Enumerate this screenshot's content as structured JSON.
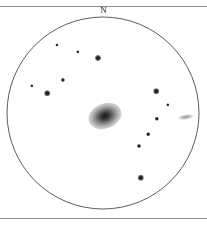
{
  "figure": {
    "type": "astronomical-finder-chart",
    "background_color": "#ffffff",
    "width": 207,
    "height": 226
  },
  "rules": {
    "top_y": 6,
    "bottom_y": 218,
    "color": "#8c8c8c"
  },
  "orientation": {
    "north_label": "N",
    "label_x": 103,
    "label_y": 11
  },
  "field_of_view": {
    "shape": "circle",
    "center_x": 103,
    "center_y": 113,
    "radius": 96,
    "stroke_color": "#4a4a4a",
    "stroke_width": 0.9,
    "fill": "none"
  },
  "chart_data": {
    "type": "scatter",
    "title": "",
    "xlabel": "",
    "ylabel": "",
    "objects": [
      {
        "name": "central-galaxy",
        "kind": "galaxy",
        "x": 105,
        "y": 116,
        "width": 34,
        "height": 25,
        "angle": -22,
        "brightness": "bright"
      },
      {
        "name": "companion-galaxy",
        "kind": "galaxy",
        "x": 186,
        "y": 117,
        "width": 15,
        "height": 5,
        "angle": -8,
        "brightness": "faint"
      },
      {
        "name": "star-01",
        "kind": "star",
        "x": 57,
        "y": 45,
        "size": 3.2,
        "brightness": "faint"
      },
      {
        "name": "star-02",
        "kind": "star",
        "x": 78,
        "y": 52,
        "size": 3.4,
        "brightness": "faint"
      },
      {
        "name": "star-03",
        "kind": "star",
        "x": 98,
        "y": 58,
        "size": 6.0,
        "brightness": "bright"
      },
      {
        "name": "star-04",
        "kind": "star",
        "x": 63,
        "y": 80,
        "size": 4.2,
        "brightness": "medium"
      },
      {
        "name": "star-05",
        "kind": "star",
        "x": 32,
        "y": 86,
        "size": 3.4,
        "brightness": "faint"
      },
      {
        "name": "star-06",
        "kind": "star",
        "x": 47,
        "y": 93,
        "size": 5.6,
        "brightness": "bright"
      },
      {
        "name": "star-07",
        "kind": "star",
        "x": 156,
        "y": 91,
        "size": 5.6,
        "brightness": "bright"
      },
      {
        "name": "star-08",
        "kind": "star",
        "x": 168,
        "y": 105,
        "size": 3.4,
        "brightness": "faint"
      },
      {
        "name": "star-09",
        "kind": "star",
        "x": 157,
        "y": 119,
        "size": 4.4,
        "brightness": "medium"
      },
      {
        "name": "star-10",
        "kind": "star",
        "x": 148,
        "y": 134,
        "size": 3.6,
        "brightness": "faint"
      },
      {
        "name": "star-11",
        "kind": "star",
        "x": 139,
        "y": 146,
        "size": 4.0,
        "brightness": "medium"
      },
      {
        "name": "star-12",
        "kind": "star",
        "x": 141,
        "y": 178,
        "size": 6.4,
        "brightness": "bright"
      }
    ],
    "legend": [],
    "grid": false
  }
}
